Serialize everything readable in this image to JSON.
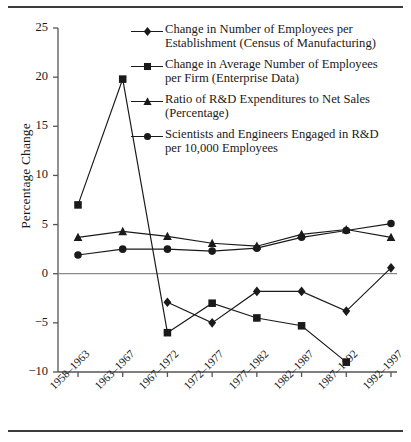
{
  "figure": {
    "top_rule": true,
    "bottom_rule": true,
    "background": "#ffffff",
    "ink": "#1a1a1a"
  },
  "axes": {
    "ylabel": "Percentage Change",
    "yticks": [
      "25",
      "20",
      "15",
      "10",
      "5",
      "0",
      "-5",
      "-10"
    ],
    "xticks": [
      "1958–1963",
      "1963–1967",
      "1967–1972",
      "1972–1977",
      "1977–1982",
      "1982–1987",
      "1987–1992",
      "1992–1997"
    ]
  },
  "legend": [
    {
      "marker": "diamond",
      "line1": "Change in Number of Employees per",
      "line2": "Establishment (Census of Manufacturing)"
    },
    {
      "marker": "square",
      "line1": "Change in  Average Number of  Employees",
      "line2": "per Firm (Enterprise Data)"
    },
    {
      "marker": "triangle",
      "line1": "Ratio of R&D Expenditures to Net Sales",
      "line2": "(Percentage)"
    },
    {
      "marker": "circle",
      "line1": "Scientists and Engineers Engaged in R&D",
      "line2": "per 10,000 Employees"
    }
  ],
  "chart_data": {
    "type": "line",
    "title": "",
    "xlabel": "",
    "ylabel": "Percentage Change",
    "ylim": [
      -10,
      25
    ],
    "ytick_step": 5,
    "grid": false,
    "zero_line": true,
    "legend_position": "top-right-inside",
    "categories": [
      "1958–1963",
      "1963–1967",
      "1967–1972",
      "1972–1977",
      "1977–1982",
      "1982–1987",
      "1987–1992",
      "1992–1997"
    ],
    "series": [
      {
        "name": "Change in Number of Employees per Establishment (Census of Manufacturing)",
        "marker": "diamond",
        "values": [
          null,
          null,
          -2.9,
          -5.0,
          -1.8,
          -1.8,
          -3.8,
          0.6
        ]
      },
      {
        "name": "Change in  Average Number of  Employees per Firm (Enterprise Data)",
        "marker": "square",
        "values": [
          7.0,
          19.8,
          -6.0,
          -3.0,
          -4.5,
          -5.3,
          -9.0,
          null
        ]
      },
      {
        "name": "Ratio of R&D Expenditures to Net Sales (Percentage)",
        "marker": "triangle",
        "values": [
          3.7,
          4.3,
          3.8,
          3.1,
          2.8,
          4.0,
          4.5,
          3.7
        ]
      },
      {
        "name": "Scientists and Engineers Engaged in R&D per 10,000 Employees",
        "marker": "circle",
        "values": [
          1.9,
          2.5,
          2.5,
          2.3,
          2.6,
          3.7,
          4.4,
          5.1
        ]
      }
    ]
  }
}
